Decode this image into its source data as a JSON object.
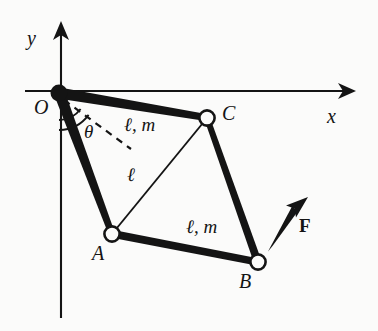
{
  "figure": {
    "kind": "mechanism-linkage-diagram",
    "background_color": "#fbfbfa",
    "ink_color": "#141414",
    "axes": {
      "x_label": "x",
      "y_label": "y",
      "x_axis": {
        "from": [
          25,
          91
        ],
        "to": [
          355,
          91
        ],
        "arrow": "right"
      },
      "y_axis": {
        "from": [
          61,
          318
        ],
        "to": [
          61,
          22
        ],
        "arrow": "up"
      },
      "x_label_pos": [
        327,
        106
      ],
      "y_label_pos": [
        27,
        28
      ]
    },
    "origin": {
      "label": "O",
      "point": [
        59,
        93
      ],
      "label_pos": [
        34,
        97
      ],
      "marker": "filled-dot",
      "marker_radius": 8
    },
    "joints": [
      {
        "label": "A",
        "point": [
          112,
          234
        ],
        "label_pos": [
          92,
          243
        ],
        "marker": "open-circle",
        "marker_radius": 8
      },
      {
        "label": "B",
        "point": [
          258,
          262
        ],
        "label_pos": [
          239,
          271
        ],
        "marker": "open-circle",
        "marker_radius": 8
      },
      {
        "label": "C",
        "point": [
          207,
          118
        ],
        "label_pos": [
          222,
          103
        ],
        "marker": "open-circle",
        "marker_radius": 8
      }
    ],
    "links": [
      {
        "name": "link-O-C",
        "from": [
          59,
          93
        ],
        "to": [
          207,
          118
        ],
        "style": "thick",
        "label": "ℓ, m",
        "label_pos": [
          124,
          122
        ]
      },
      {
        "name": "link-O-A",
        "from": [
          59,
          93
        ],
        "to": [
          112,
          234
        ],
        "style": "thick",
        "label": "",
        "label_pos": null
      },
      {
        "name": "link-A-B",
        "from": [
          112,
          234
        ],
        "to": [
          258,
          262
        ],
        "style": "thick",
        "label": "ℓ, m",
        "label_pos": [
          186,
          224
        ]
      },
      {
        "name": "link-C-B",
        "from": [
          207,
          118
        ],
        "to": [
          258,
          262
        ],
        "style": "thick",
        "label": "",
        "label_pos": null
      },
      {
        "name": "link-A-C",
        "from": [
          112,
          234
        ],
        "to": [
          207,
          118
        ],
        "style": "thin",
        "label": "ℓ",
        "label_pos": [
          126,
          172
        ]
      }
    ],
    "angle": {
      "label": "θ",
      "label_pos": [
        84,
        130
      ],
      "vertex": [
        59,
        93
      ],
      "arc_radius_inner": 27,
      "arc_radius_outer": 37,
      "from_ray": "negative-y-axis",
      "to_ray": "dashed-reference-line"
    },
    "dashed_line": {
      "name": "reference-line",
      "from": [
        63,
        99
      ],
      "to": [
        131,
        149
      ],
      "dash": "6,5"
    },
    "force": {
      "label": "F",
      "label_pos": [
        299,
        223
      ],
      "arrow_from": [
        270,
        249
      ],
      "arrow_to": [
        307,
        199
      ],
      "style": "bold-arrow"
    }
  }
}
